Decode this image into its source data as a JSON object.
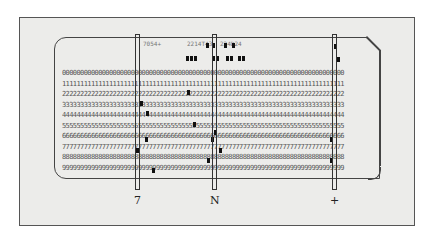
{
  "figure": {
    "printed_header": [
      "7054+",
      "2214T43",
      "224D24"
    ],
    "row_digits": [
      "0",
      "1",
      "2",
      "3",
      "4",
      "5",
      "6",
      "7",
      "8",
      "9"
    ],
    "column_labels": [
      "7",
      "N",
      "+"
    ],
    "highlighted_columns_x": [
      137,
      214,
      334
    ],
    "colors": {
      "background": "#ececea",
      "hole": "#111111",
      "border": "#444444"
    }
  }
}
